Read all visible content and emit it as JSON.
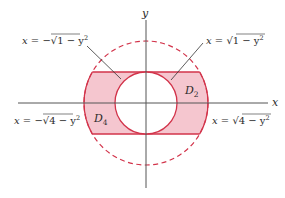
{
  "figure": {
    "type": "region-diagram",
    "colors": {
      "region_fill": "#f5c6cf",
      "region_stroke": "#d2334a",
      "dashed_circle": "#d2334a",
      "axis": "#555555",
      "leader": "#333333",
      "text": "#2b2b2b"
    },
    "geometry": {
      "origin_px": [
        146,
        103
      ],
      "unit_px": 31,
      "inner_radius": 1,
      "outer_radius": 2,
      "strip_y_range": [
        -1,
        1
      ]
    },
    "axes": {
      "x_label": "x",
      "y_label": "y"
    },
    "regions": [
      {
        "id": "D2",
        "label": "D",
        "subscript": "2"
      },
      {
        "id": "D4",
        "label": "D",
        "subscript": "4"
      }
    ],
    "curve_labels": {
      "inner_left": {
        "lhs": "x",
        "eq": " = −",
        "radicand": "1 − y",
        "exp": "2"
      },
      "inner_right": {
        "lhs": "x",
        "eq": " = ",
        "radicand": "1 − y",
        "exp": "2"
      },
      "outer_left": {
        "lhs": "x",
        "eq": " = −",
        "radicand": "4 − y",
        "exp": "2"
      },
      "outer_right": {
        "lhs": "x",
        "eq": " = ",
        "radicand": "4 − y",
        "exp": "2"
      }
    }
  }
}
